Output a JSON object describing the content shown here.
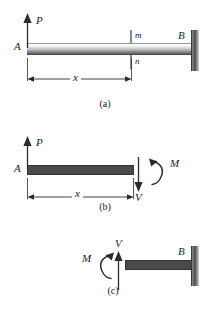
{
  "figure": {
    "panels": [
      {
        "caption": "(a)",
        "labels": {
          "load": "P",
          "free_end": "A",
          "fixed_end": "B",
          "section_top": "m",
          "section_bottom": "n",
          "distance": "x"
        }
      },
      {
        "caption": "(b)",
        "labels": {
          "load": "P",
          "free_end": "A",
          "shear": "V",
          "moment": "M",
          "distance": "x"
        }
      },
      {
        "caption": "(c)",
        "labels": {
          "shear": "V",
          "moment": "M",
          "fixed_end": "B"
        }
      }
    ]
  },
  "colors": {
    "ink": "#2b2b2b",
    "beam_solid": "#4a4a4a",
    "wall": "#5f5f5f"
  }
}
